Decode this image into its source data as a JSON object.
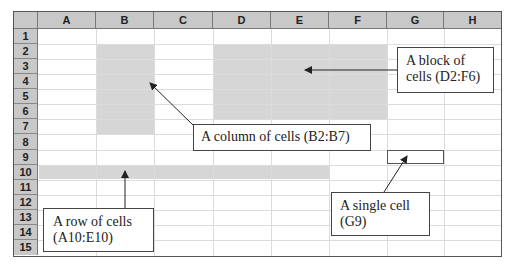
{
  "spreadsheet": {
    "columns": [
      "A",
      "B",
      "C",
      "D",
      "E",
      "F",
      "G",
      "H"
    ],
    "rows": [
      "1",
      "2",
      "3",
      "4",
      "5",
      "6",
      "7",
      "8",
      "9",
      "10",
      "11",
      "12",
      "13",
      "14",
      "15"
    ]
  },
  "callouts": {
    "block": {
      "line1": "A block of",
      "line2": "cells (D2:F6)"
    },
    "column": {
      "line1": "A column of cells (B2:B7)"
    },
    "single": {
      "line1": "A single cell",
      "line2": "(G9)"
    },
    "row": {
      "line1": "A row of cells",
      "line2": "(A10:E10)"
    }
  },
  "colors": {
    "header_bg": "#c8c8c8",
    "shade": "#d6d6d6",
    "gridline": "#dcdcdc"
  }
}
